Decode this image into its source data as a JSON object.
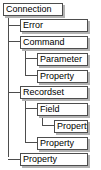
{
  "diagram": {
    "type": "tree",
    "background_color": "#ffffff",
    "box_border_color": "#4d4d4d",
    "box_fill_color": "#ffffff",
    "box_shadow_color": "#b3b3b3",
    "connector_color": "#4d4d4d",
    "nodes": [
      {
        "id": "connection",
        "label": "Connection",
        "level": 0,
        "x": 3,
        "y": 3,
        "width": 60
      },
      {
        "id": "error",
        "label": "Error",
        "level": 1,
        "x": 20,
        "y": 22,
        "width": 68
      },
      {
        "id": "command",
        "label": "Command",
        "level": 1,
        "x": 20,
        "y": 41,
        "width": 68
      },
      {
        "id": "command-parameter",
        "label": "Parameter",
        "level": 2,
        "x": 37,
        "y": 60,
        "width": 51
      },
      {
        "id": "command-property",
        "label": "Property",
        "level": 2,
        "x": 37,
        "y": 79,
        "width": 51
      },
      {
        "id": "recordset",
        "label": "Recordset",
        "level": 1,
        "x": 20,
        "y": 98,
        "width": 68
      },
      {
        "id": "recordset-field",
        "label": "Field",
        "level": 2,
        "x": 37,
        "y": 117,
        "width": 51
      },
      {
        "id": "field-property",
        "label": "Property",
        "level": 3,
        "x": 54,
        "y": 136,
        "width": 34
      },
      {
        "id": "recordset-property",
        "label": "Property",
        "level": 2,
        "x": 37,
        "y": 155,
        "width": 51
      },
      {
        "id": "connection-property",
        "label": "Property",
        "level": 1,
        "x": 20,
        "y": 174,
        "width": 68
      }
    ],
    "trunks": [
      {
        "id": "trunk-connection",
        "x": 8,
        "y": 16,
        "height": 162
      },
      {
        "id": "trunk-command",
        "x": 25,
        "y": 54,
        "height": 32
      },
      {
        "id": "trunk-recordset",
        "x": 25,
        "y": 111,
        "height": 51
      },
      {
        "id": "trunk-field",
        "x": 42,
        "y": 130,
        "height": 13
      }
    ],
    "branches": [
      {
        "id": "branch-error",
        "x": 8,
        "y": 28,
        "width": 12
      },
      {
        "id": "branch-command",
        "x": 8,
        "y": 47,
        "width": 12
      },
      {
        "id": "branch-command-parameter",
        "x": 25,
        "y": 66,
        "width": 12
      },
      {
        "id": "branch-command-property",
        "x": 25,
        "y": 85,
        "width": 12
      },
      {
        "id": "branch-recordset",
        "x": 8,
        "y": 104,
        "width": 12
      },
      {
        "id": "branch-recordset-field",
        "x": 25,
        "y": 123,
        "width": 12
      },
      {
        "id": "branch-field-property",
        "x": 42,
        "y": 142,
        "width": 12
      },
      {
        "id": "branch-recordset-property",
        "x": 25,
        "y": 161,
        "width": 12
      },
      {
        "id": "branch-connection-property",
        "x": 8,
        "y": 180,
        "width": 12
      }
    ]
  }
}
